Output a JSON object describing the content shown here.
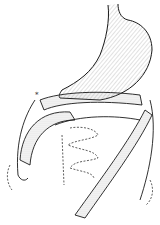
{
  "figure": {
    "annotation_mark": "*",
    "colors": {
      "ink": "#1a1a1a",
      "stipple": "#bdbdbd",
      "background": "#ffffff"
    }
  }
}
